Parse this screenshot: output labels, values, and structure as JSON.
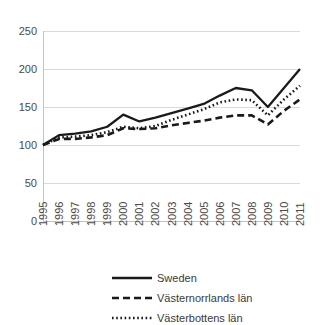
{
  "chart_data": {
    "type": "line",
    "title": "",
    "subtitle": "",
    "xlabel": "",
    "ylabel": "",
    "grid": true,
    "legend_position": "bottom",
    "ylim": [
      0,
      250
    ],
    "yticks": [
      "0",
      "50",
      "100",
      "150",
      "200",
      "250"
    ],
    "categories": [
      "1995",
      "1996",
      "1997",
      "1998",
      "1999",
      "2000",
      "2001",
      "2002",
      "2003",
      "2004",
      "2005",
      "2006",
      "2007",
      "2008",
      "2009",
      "2010",
      "2011"
    ],
    "series": [
      {
        "name": "Sweden",
        "style": "solid",
        "values": [
          100,
          113,
          115,
          118,
          124,
          140,
          131,
          136,
          142,
          148,
          154,
          165,
          175,
          172,
          150,
          175,
          200
        ]
      },
      {
        "name": "Västernorrlands län",
        "style": "dashed",
        "values": [
          100,
          108,
          108,
          110,
          113,
          122,
          121,
          122,
          126,
          129,
          132,
          136,
          139,
          139,
          127,
          145,
          160
        ]
      },
      {
        "name": "Västerbottens län",
        "style": "dotted",
        "values": [
          100,
          110,
          111,
          113,
          117,
          124,
          122,
          125,
          133,
          140,
          147,
          156,
          160,
          159,
          139,
          160,
          178
        ]
      }
    ]
  },
  "legend": {
    "items": [
      {
        "label": "Sweden",
        "style": "solid"
      },
      {
        "label": "Västernorrlands län",
        "style": "dashed"
      },
      {
        "label": "Västerbottens län",
        "style": "dotted"
      }
    ]
  },
  "colors": {
    "line": "#1a1a1a",
    "grid": "#d9d9d9",
    "axis": "#c4c4c4",
    "text": "#4a4a4a",
    "background": "#ffffff"
  }
}
